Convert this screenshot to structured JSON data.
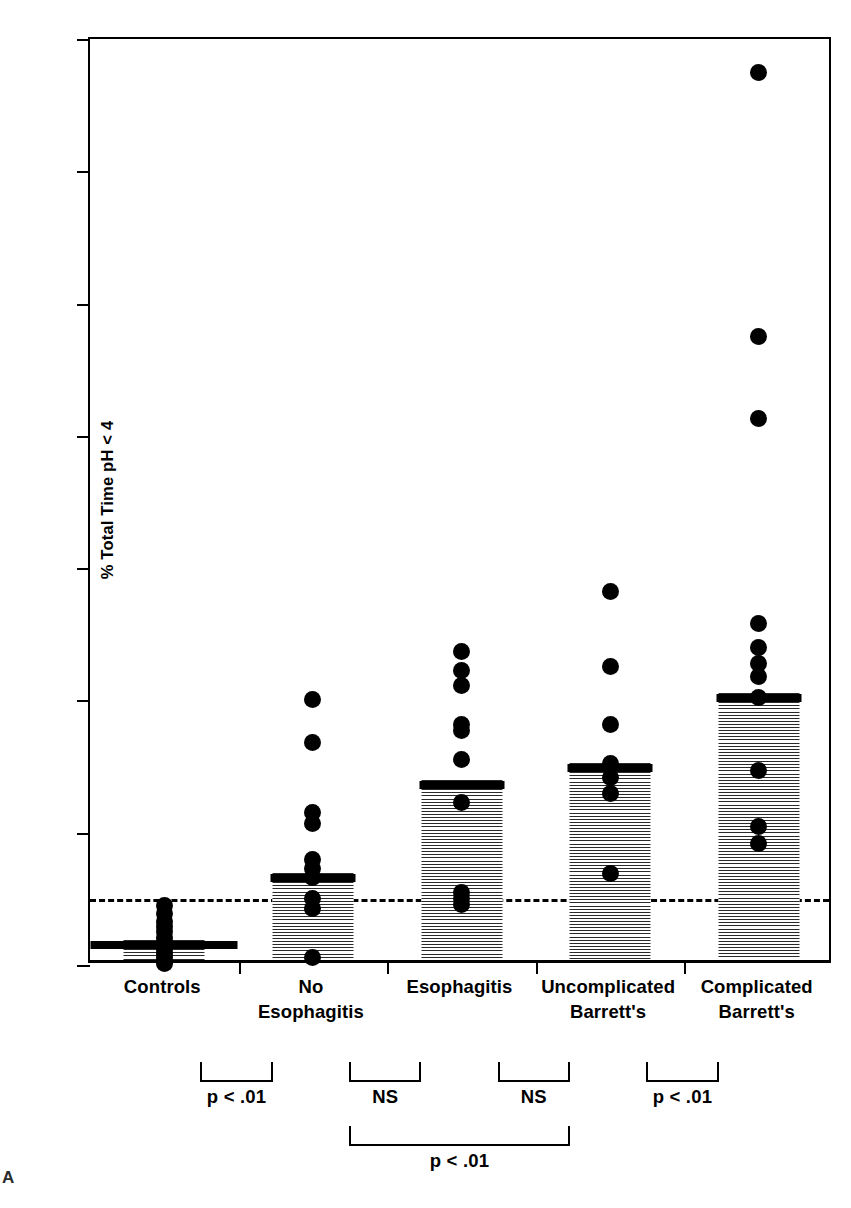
{
  "figure": {
    "panel_letter": "A",
    "axis_color": "#000000",
    "bar_fill_color": "#808080",
    "point_color": "#000000"
  },
  "chart_data": {
    "type": "bar",
    "title": "",
    "xlabel": "",
    "ylabel": "% Total Time pH < 4",
    "ylim": [
      0,
      70
    ],
    "yticks": [
      0,
      10,
      20,
      30,
      40,
      50,
      60,
      70
    ],
    "ytick_labels": [
      "0",
      "10",
      "20",
      "30",
      "40",
      "50",
      "60",
      "70"
    ],
    "grid": false,
    "legend": "none",
    "reference_line": {
      "value": 5,
      "style": "dashed",
      "label": ""
    },
    "categories": [
      "Controls",
      "No Esophagitis",
      "Esophagitis",
      "Uncomplicated Barrett's",
      "Complicated Barrett's"
    ],
    "category_label_lines": [
      [
        "Controls"
      ],
      [
        "No",
        "Esophagitis"
      ],
      [
        "Esophagitis"
      ],
      [
        "Uncomplicated",
        "Barrett's"
      ],
      [
        "Complicated",
        "Barrett's"
      ]
    ],
    "values": [
      1.5,
      6.6,
      13.6,
      14.9,
      20.2
    ],
    "series": [
      {
        "name": "Mean % total time pH < 4",
        "values": [
          1.5,
          6.6,
          13.6,
          14.9,
          20.2
        ]
      }
    ],
    "points": [
      {
        "category": "Controls",
        "values": [
          4.5,
          3.9,
          3.3,
          2.9,
          2.5,
          2.1,
          1.8,
          1.5,
          1.2,
          0.9,
          0.6,
          0.3,
          0.1
        ]
      },
      {
        "category": "No Esophagitis",
        "values": [
          20.1,
          16.8,
          11.5,
          10.7,
          8.0,
          7.3,
          6.6,
          5.0,
          4.3,
          0.6
        ]
      },
      {
        "category": "Esophagitis",
        "values": [
          23.7,
          22.3,
          21.1,
          18.2,
          17.7,
          15.5,
          12.3,
          5.5,
          5.0,
          4.6
        ]
      },
      {
        "category": "Uncomplicated Barrett's",
        "values": [
          28.2,
          22.6,
          18.2,
          15.2,
          14.2,
          13.0,
          6.9
        ]
      },
      {
        "category": "Complicated Barrett's",
        "values": [
          67.5,
          47.5,
          41.3,
          25.8,
          24.0,
          22.8,
          21.8,
          20.2,
          14.7,
          10.5,
          9.2
        ]
      }
    ],
    "annotations": [
      {
        "text": "p < .01",
        "between": [
          "Controls",
          "No Esophagitis"
        ],
        "row": 1
      },
      {
        "text": "NS",
        "between": [
          "No Esophagitis",
          "Esophagitis"
        ],
        "row": 1
      },
      {
        "text": "NS",
        "between": [
          "Esophagitis",
          "Uncomplicated Barrett's"
        ],
        "row": 1
      },
      {
        "text": "p < .01",
        "between": [
          "Uncomplicated Barrett's",
          "Complicated Barrett's"
        ],
        "row": 1
      },
      {
        "text": "p < .01",
        "between": [
          "No Esophagitis",
          "Uncomplicated Barrett's"
        ],
        "row": 2
      }
    ]
  }
}
